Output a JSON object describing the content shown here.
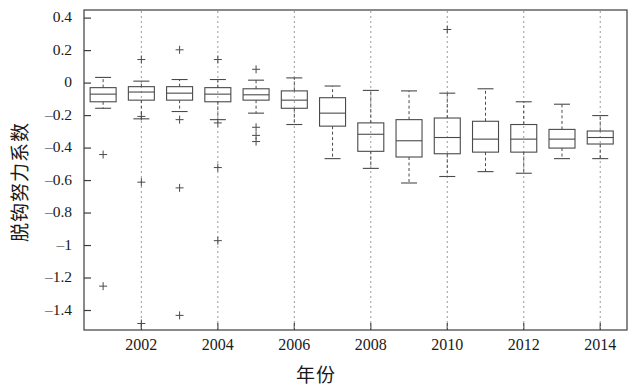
{
  "chart_data": {
    "type": "box",
    "title": "",
    "xlabel": "年份",
    "ylabel": "脱钩努力系数",
    "xlim": [
      2000.5,
      2014.7
    ],
    "ylim": [
      -1.52,
      0.45
    ],
    "grid": false,
    "x_ticks": [
      2002,
      2004,
      2006,
      2008,
      2010,
      2012,
      2014
    ],
    "x_tick_labels": [
      "2002",
      "2004",
      "2006",
      "2008",
      "2010",
      "2012",
      "2014"
    ],
    "y_ticks": [
      0.4,
      0.2,
      0,
      -0.2,
      -0.4,
      -0.6,
      -0.8,
      -1,
      -1.2,
      -1.4
    ],
    "y_tick_labels": [
      "0.4",
      "0.2",
      "0",
      "–0.2",
      "–0.4",
      "–0.6",
      "–0.8",
      "–1",
      "–1.2",
      "–1.4"
    ],
    "box_color": "#4a4a4a",
    "whisker_style": "dashed",
    "outlier_marker": "+",
    "categories": [
      2001,
      2002,
      2003,
      2004,
      2005,
      2006,
      2007,
      2008,
      2009,
      2010,
      2011,
      2012,
      2013,
      2014
    ],
    "boxes": [
      {
        "year": 2001,
        "whisker_low": -0.155,
        "q1": -0.115,
        "median": -0.068,
        "q3": -0.028,
        "whisker_high": 0.035,
        "outliers": [
          -0.44,
          -1.25
        ]
      },
      {
        "year": 2002,
        "whisker_low": -0.22,
        "q1": -0.105,
        "median": -0.055,
        "q3": -0.022,
        "whisker_high": 0.012,
        "outliers": [
          0.145,
          -0.205,
          -0.61,
          -1.48
        ]
      },
      {
        "year": 2003,
        "whisker_low": -0.175,
        "q1": -0.105,
        "median": -0.062,
        "q3": -0.022,
        "whisker_high": 0.022,
        "outliers": [
          0.205,
          -0.225,
          -0.645,
          -1.43
        ]
      },
      {
        "year": 2004,
        "whisker_low": -0.225,
        "q1": -0.115,
        "median": -0.068,
        "q3": -0.028,
        "whisker_high": 0.022,
        "outliers": [
          0.145,
          -0.245,
          -0.52,
          -0.97
        ]
      },
      {
        "year": 2005,
        "whisker_low": -0.185,
        "q1": -0.105,
        "median": -0.072,
        "q3": -0.035,
        "whisker_high": 0.018,
        "outliers": [
          0.085,
          -0.272,
          -0.322,
          -0.36
        ]
      },
      {
        "year": 2006,
        "whisker_low": -0.255,
        "q1": -0.155,
        "median": -0.105,
        "q3": -0.048,
        "whisker_high": 0.032,
        "outliers": []
      },
      {
        "year": 2007,
        "whisker_low": -0.465,
        "q1": -0.265,
        "median": -0.185,
        "q3": -0.09,
        "whisker_high": -0.018,
        "outliers": []
      },
      {
        "year": 2008,
        "whisker_low": -0.525,
        "q1": -0.42,
        "median": -0.315,
        "q3": -0.245,
        "whisker_high": -0.045,
        "outliers": []
      },
      {
        "year": 2009,
        "whisker_low": -0.615,
        "q1": -0.455,
        "median": -0.355,
        "q3": -0.225,
        "whisker_high": -0.048,
        "outliers": []
      },
      {
        "year": 2010,
        "whisker_low": -0.575,
        "q1": -0.435,
        "median": -0.335,
        "q3": -0.215,
        "whisker_high": -0.062,
        "outliers": [
          0.33
        ]
      },
      {
        "year": 2011,
        "whisker_low": -0.545,
        "q1": -0.425,
        "median": -0.345,
        "q3": -0.235,
        "whisker_high": -0.035,
        "outliers": []
      },
      {
        "year": 2012,
        "whisker_low": -0.555,
        "q1": -0.425,
        "median": -0.345,
        "q3": -0.255,
        "whisker_high": -0.115,
        "outliers": []
      },
      {
        "year": 2013,
        "whisker_low": -0.465,
        "q1": -0.4,
        "median": -0.345,
        "q3": -0.285,
        "whisker_high": -0.13,
        "outliers": []
      },
      {
        "year": 2014,
        "whisker_low": -0.465,
        "q1": -0.375,
        "median": -0.335,
        "q3": -0.295,
        "whisker_high": -0.2,
        "outliers": []
      }
    ]
  },
  "axes": {
    "y_label": "脱钩努力系数",
    "x_label": "年份",
    "y_tick_labels": [
      "0.4",
      "0.2",
      "0",
      "–0.2",
      "–0.4",
      "–0.6",
      "–0.8",
      "–1",
      "–1.2",
      "–1.4"
    ],
    "x_tick_labels": [
      "2002",
      "2004",
      "2006",
      "2008",
      "2010",
      "2012",
      "2014"
    ]
  }
}
